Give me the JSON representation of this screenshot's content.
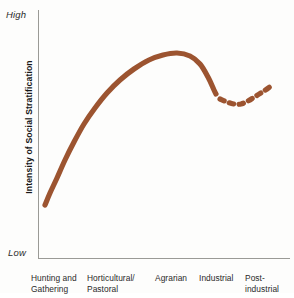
{
  "chart_data": {
    "type": "line",
    "title": "",
    "xlabel": "",
    "ylabel": "Intensity of Social Stratification",
    "y_axis": {
      "top_label": "High",
      "bottom_label": "Low",
      "ticks": [],
      "grid": false
    },
    "x_axis": {
      "grid": false,
      "ticks": []
    },
    "legend": {
      "show": false,
      "position": "none"
    },
    "categories": [
      "Hunting and Gathering",
      "Horticultural/Pastoral",
      "Agrarian",
      "Industrial",
      "Post-industrial"
    ],
    "category_labels": [
      {
        "line1": "Hunting and",
        "line2": "Gathering"
      },
      {
        "line1": "Horticultural/",
        "line2": "Pastoral"
      },
      {
        "line1": "Agrarian",
        "line2": ""
      },
      {
        "line1": "Industrial",
        "line2": ""
      },
      {
        "line1": "Post-",
        "line2": "industrial"
      }
    ],
    "series": [
      {
        "name": "Intensity of Social Stratification",
        "style": "solid",
        "color": "#9c5430",
        "values": [
          0.2,
          0.78,
          0.95,
          0.66,
          0.72
        ],
        "points": [
          [
            45,
            205
          ],
          [
            50,
            193
          ],
          [
            57,
            178
          ],
          [
            65,
            160
          ],
          [
            74,
            142
          ],
          [
            84,
            124
          ],
          [
            95,
            108
          ],
          [
            107,
            93
          ],
          [
            120,
            80
          ],
          [
            134,
            69
          ],
          [
            149,
            60
          ],
          [
            163,
            55
          ],
          [
            177,
            53
          ],
          [
            190,
            56
          ],
          [
            200,
            64
          ],
          [
            208,
            77
          ],
          [
            214,
            90
          ],
          [
            216,
            94
          ]
        ]
      },
      {
        "name": "Projected trend",
        "style": "dashed",
        "color": "#9c5430",
        "points": [
          [
            220,
            99
          ],
          [
            227,
            102
          ],
          [
            234,
            104
          ],
          [
            241,
            104
          ],
          [
            248,
            101
          ],
          [
            256,
            96
          ],
          [
            264,
            91
          ],
          [
            271,
            86
          ]
        ]
      }
    ],
    "curve_color": "#9c5430",
    "axis_color": "#9a9a96",
    "background_color": "#fdfdfc",
    "annotations": []
  }
}
